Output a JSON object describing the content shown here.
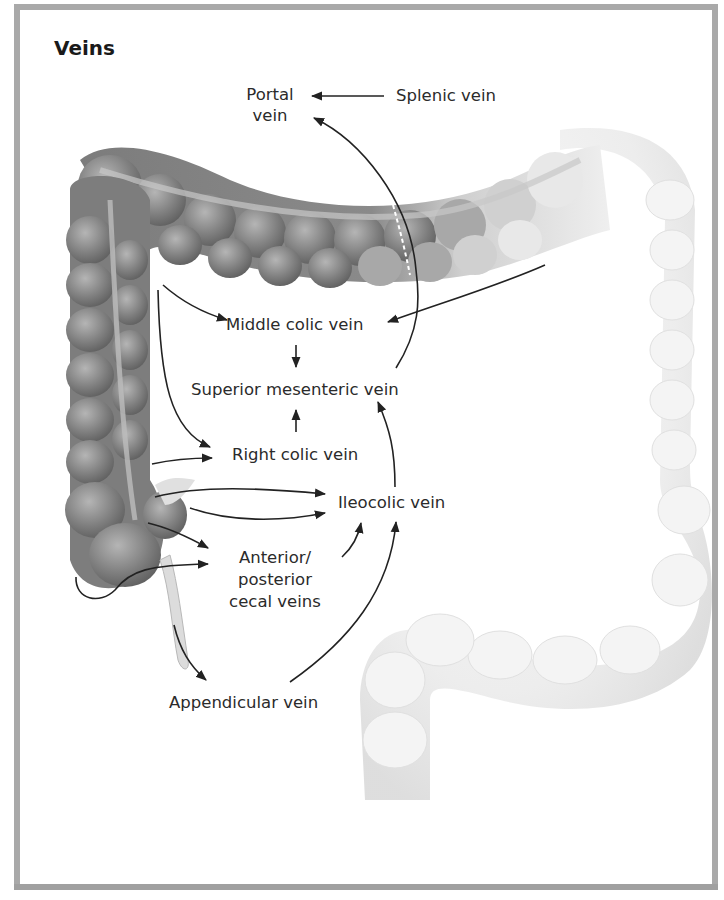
{
  "figure": {
    "title": "Veins",
    "labels": {
      "portal_vein_line1": "Portal",
      "portal_vein_line2": "vein",
      "splenic_vein": "Splenic vein",
      "middle_colic_vein": "Middle colic vein",
      "superior_mesenteric_vein": "Superior mesenteric vein",
      "right_colic_vein": "Right colic vein",
      "ileocolic_vein": "Ileocolic vein",
      "cecal_veins_line1": "Anterior/",
      "cecal_veins_line2": "posterior",
      "cecal_veins_line3": "cecal veins",
      "appendicular_vein": "Appendicular vein"
    },
    "colors": {
      "frame": "#a9a9a9",
      "colon_dark": "#7a7a7a",
      "colon_light": "#e6e6e6",
      "arrow": "#222222",
      "text": "#2b2b2b"
    }
  }
}
